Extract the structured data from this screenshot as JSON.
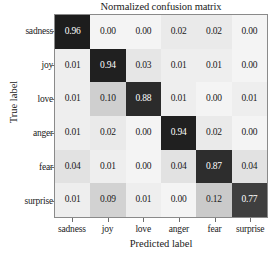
{
  "chart_data": {
    "type": "heatmap",
    "title": "Normalized confusion matrix",
    "xlabel": "Predicted label",
    "ylabel": "True label",
    "x_categories": [
      "sadness",
      "joy",
      "love",
      "anger",
      "fear",
      "surprise"
    ],
    "y_categories": [
      "sadness",
      "joy",
      "love",
      "anger",
      "fear",
      "surprise"
    ],
    "colormap": "Greys",
    "vmin": 0.0,
    "vmax": 1.0,
    "grid": false,
    "legend": "none",
    "colorbar": false,
    "rows": [
      {
        "label": "sadness",
        "values": [
          0.96,
          0.0,
          0.0,
          0.02,
          0.02,
          0.0
        ],
        "text": [
          "0.96",
          "0.00",
          "0.00",
          "0.02",
          "0.02",
          "0.00"
        ]
      },
      {
        "label": "joy",
        "values": [
          0.01,
          0.94,
          0.03,
          0.01,
          0.01,
          0.0
        ],
        "text": [
          "0.01",
          "0.94",
          "0.03",
          "0.01",
          "0.01",
          "0.00"
        ]
      },
      {
        "label": "love",
        "values": [
          0.01,
          0.1,
          0.88,
          0.01,
          0.0,
          0.01
        ],
        "text": [
          "0.01",
          "0.10",
          "0.88",
          "0.01",
          "0.00",
          "0.01"
        ]
      },
      {
        "label": "anger",
        "values": [
          0.01,
          0.02,
          0.0,
          0.94,
          0.02,
          0.0
        ],
        "text": [
          "0.01",
          "0.02",
          "0.00",
          "0.94",
          "0.02",
          "0.00"
        ]
      },
      {
        "label": "fear",
        "values": [
          0.04,
          0.01,
          0.0,
          0.04,
          0.87,
          0.04
        ],
        "text": [
          "0.04",
          "0.01",
          "0.00",
          "0.04",
          "0.87",
          "0.04"
        ]
      },
      {
        "label": "surprise",
        "values": [
          0.01,
          0.09,
          0.01,
          0.0,
          0.12,
          0.77
        ],
        "text": [
          "0.01",
          "0.09",
          "0.01",
          "0.00",
          "0.12",
          "0.77"
        ]
      }
    ]
  },
  "colors": {
    "dark_text": "#1a1a1a",
    "light_text": "#ffffff",
    "axis_line": "#8a8a8a",
    "background": "#ffffff"
  }
}
